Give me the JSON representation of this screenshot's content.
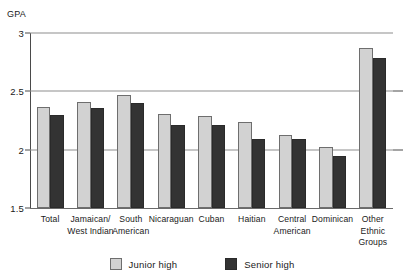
{
  "chart_data": {
    "type": "bar",
    "title": "",
    "xlabel": "",
    "ylabel": "GPA",
    "ylim": [
      1.5,
      3.0
    ],
    "yticks": [
      "1.5",
      "2",
      "2.5",
      "3"
    ],
    "ytick_values": [
      1.5,
      2.0,
      2.5,
      3.0
    ],
    "grid": true,
    "legend_position": "bottom",
    "categories": [
      "Total",
      "Jamaican/\nWest Indian",
      "South\nAmerican",
      "Nicaraguan",
      "Cuban",
      "Haitian",
      "Central\nAmerican",
      "Dominican",
      "Other\nEthnic\nGroups"
    ],
    "series": [
      {
        "name": "Junior high",
        "color": "#d2d2d2",
        "values": [
          2.37,
          2.41,
          2.47,
          2.31,
          2.29,
          2.24,
          2.13,
          2.02,
          2.87
        ]
      },
      {
        "name": "Senior high",
        "color": "#333333",
        "values": [
          2.3,
          2.36,
          2.4,
          2.21,
          2.21,
          2.09,
          2.09,
          1.95,
          2.79
        ]
      }
    ]
  },
  "legend": {
    "items": [
      {
        "label": "Junior high"
      },
      {
        "label": "Senior high"
      }
    ]
  }
}
